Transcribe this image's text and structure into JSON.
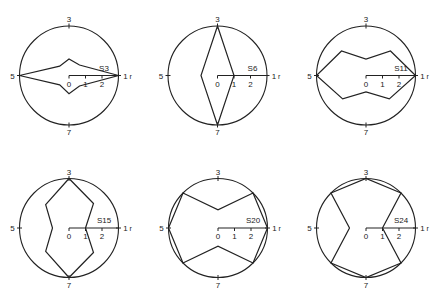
{
  "figure": {
    "background": "#ffffff",
    "line_color": "#222222",
    "direction_labels": [
      "1",
      "3",
      "5",
      "7"
    ],
    "axis_tick_labels": [
      "0",
      "1",
      "2"
    ],
    "radial_axis_label": "r",
    "rmax": 3
  },
  "chart_data": [
    {
      "type": "radar",
      "title": "S3",
      "directions": [
        1,
        2,
        3,
        4,
        5,
        6,
        7,
        8
      ],
      "values": [
        3,
        0.9,
        1.0,
        0.8,
        3,
        0.8,
        1.1,
        0.9
      ],
      "rlim": [
        0,
        3
      ],
      "rticks": [
        0,
        1,
        2
      ],
      "grid": false
    },
    {
      "type": "radar",
      "title": "S6",
      "directions": [
        1,
        2,
        3,
        4,
        5,
        6,
        7,
        8
      ],
      "values": [
        1,
        1.06,
        3,
        1.06,
        1,
        1.06,
        3,
        1.06
      ],
      "rlim": [
        0,
        3
      ],
      "rticks": [
        0,
        1,
        2
      ],
      "grid": false
    },
    {
      "type": "radar",
      "title": "S11",
      "directions": [
        1,
        2,
        3,
        4,
        5,
        6,
        7,
        8
      ],
      "values": [
        3,
        2.1,
        1.0,
        2.1,
        3,
        2.0,
        1.0,
        2.0
      ],
      "rlim": [
        0,
        3
      ],
      "rticks": [
        0,
        1,
        2
      ],
      "grid": false
    },
    {
      "type": "radar",
      "title": "S15",
      "directions": [
        1,
        2,
        3,
        4,
        5,
        6,
        7,
        8
      ],
      "values": [
        1,
        2.1,
        3,
        2.0,
        1,
        2.0,
        3,
        2.1
      ],
      "rlim": [
        0,
        3
      ],
      "rticks": [
        0,
        1,
        2
      ],
      "grid": false
    },
    {
      "type": "radar",
      "title": "S20",
      "directions": [
        1,
        2,
        3,
        4,
        5,
        6,
        7,
        8
      ],
      "values": [
        3,
        3,
        1.1,
        3,
        3,
        3,
        1.1,
        3
      ],
      "rlim": [
        0,
        3
      ],
      "rticks": [
        0,
        1,
        2
      ],
      "grid": false
    },
    {
      "type": "radar",
      "title": "S24",
      "directions": [
        1,
        2,
        3,
        4,
        5,
        6,
        7,
        8
      ],
      "values": [
        1,
        3,
        3,
        3,
        1,
        3,
        3,
        3
      ],
      "rlim": [
        0,
        3
      ],
      "rticks": [
        0,
        1,
        2
      ],
      "grid": false
    }
  ],
  "layout": {
    "centers": [
      [
        69,
        75.5
      ],
      [
        217.5,
        75.5
      ],
      [
        366,
        75.5
      ],
      [
        69,
        228
      ],
      [
        218,
        228
      ],
      [
        366,
        228
      ]
    ],
    "radius": 49.5
  }
}
